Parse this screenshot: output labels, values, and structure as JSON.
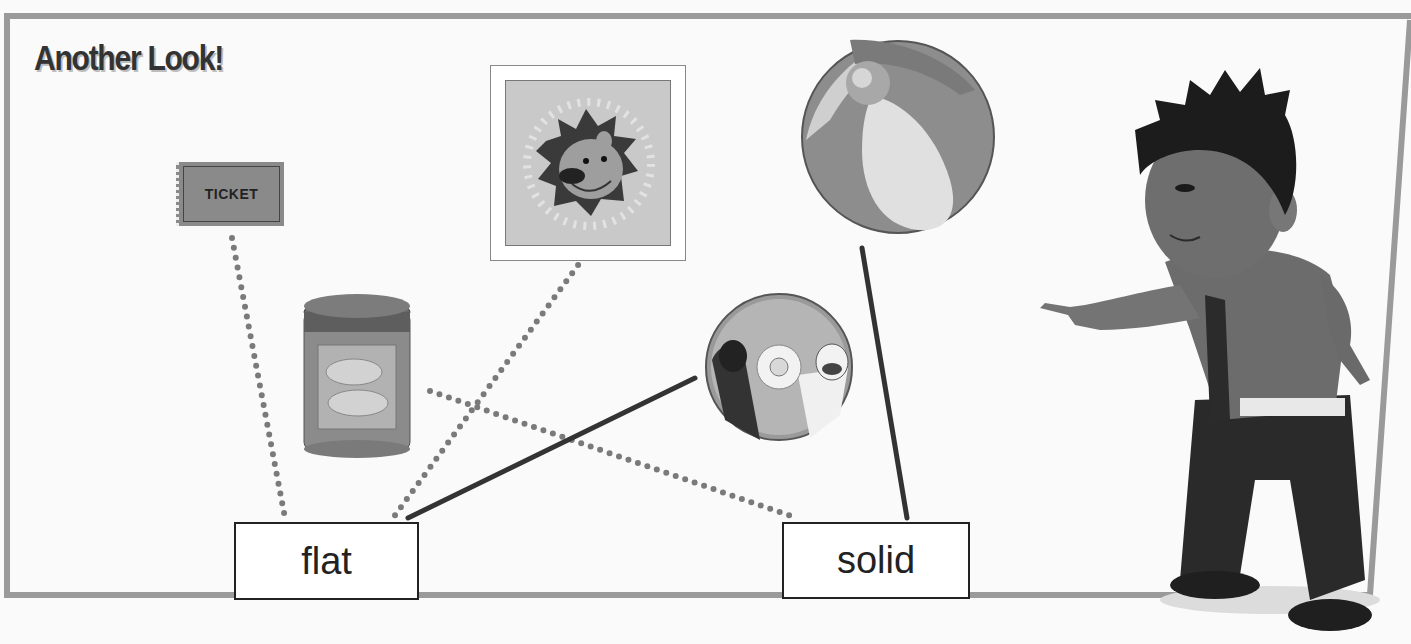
{
  "worksheet": {
    "title": "Another Look!",
    "objects": [
      {
        "name": "ticket",
        "label_text": "TICKET",
        "answer": "flat",
        "connector": "dotted"
      },
      {
        "name": "lion-stamp",
        "answer": "flat",
        "connector": "dotted"
      },
      {
        "name": "beach-ball",
        "answer": "solid",
        "connector": "solid"
      },
      {
        "name": "peanut-can",
        "answer": "solid",
        "connector": "dotted"
      },
      {
        "name": "cd-disc",
        "answer": "flat",
        "connector": "solid"
      }
    ],
    "categories": [
      {
        "label": "flat"
      },
      {
        "label": "solid"
      }
    ]
  },
  "colors": {
    "border": "#9a9a9a",
    "ink": "#222222",
    "dots": "#7a7a7a",
    "background": "#fafafa"
  }
}
